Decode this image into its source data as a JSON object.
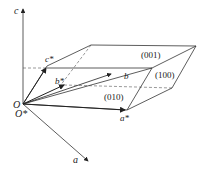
{
  "diagram": {
    "colors": {
      "line": "#333333",
      "dashed": "#555555",
      "background": "#ffffff"
    },
    "labels": {
      "c": "c",
      "c_star": "c*",
      "b_star": "b*",
      "b": "b",
      "O": "O",
      "O_star": "O*",
      "a": "a",
      "a_star": "a*",
      "plane_001": "(001)",
      "plane_100": "(100)",
      "plane_010": "(010)"
    }
  }
}
